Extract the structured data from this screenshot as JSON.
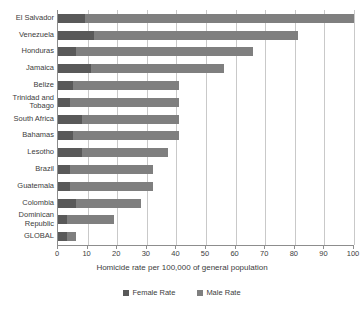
{
  "chart_data": {
    "type": "bar",
    "orientation": "horizontal",
    "stacked": true,
    "title": "",
    "xlabel": "Homicide rate per 100,000 of general population",
    "ylabel": "",
    "xlim": [
      0,
      100
    ],
    "xticks": [
      0,
      10,
      20,
      30,
      40,
      50,
      60,
      70,
      80,
      90,
      100
    ],
    "grid": true,
    "legend_position": "bottom",
    "categories": [
      "El Salvador",
      "Venezuela",
      "Honduras",
      "Jamaica",
      "Belize",
      "Trinidad and Tobago",
      "South Africa",
      "Bahamas",
      "Lesotho",
      "Brazil",
      "Guatemala",
      "Colombia",
      "Dominican Republic",
      "GLOBAL"
    ],
    "series": [
      {
        "name": "Female Rate",
        "color": "#595959",
        "values": [
          9,
          12,
          6,
          11,
          5,
          4,
          8,
          5,
          8,
          4,
          4,
          6,
          3,
          3
        ]
      },
      {
        "name": "Male Rate",
        "color": "#7f7f7f",
        "values": [
          91,
          69,
          60,
          45,
          36,
          37,
          33,
          36,
          29,
          28,
          28,
          22,
          16,
          3
        ]
      }
    ],
    "totals": [
      100,
      81,
      66,
      56,
      41,
      41,
      41,
      41,
      37,
      32,
      32,
      28,
      19,
      6
    ]
  },
  "legend": {
    "items": [
      {
        "label": "Female Rate",
        "color": "#595959"
      },
      {
        "label": "Male Rate",
        "color": "#7f7f7f"
      }
    ]
  },
  "axis": {
    "x_title": "Homicide rate per 100,000 of general population",
    "tick_labels": [
      "0",
      "10",
      "20",
      "30",
      "40",
      "50",
      "60",
      "70",
      "80",
      "90",
      "100"
    ]
  }
}
